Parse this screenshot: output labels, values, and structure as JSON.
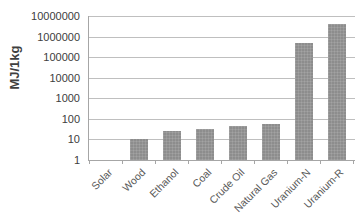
{
  "chart_data": {
    "type": "bar",
    "title": "",
    "xlabel": "",
    "ylabel": "MJ/1kg",
    "yscale": "log",
    "ylim": [
      1,
      10000000
    ],
    "grid": true,
    "legend": false,
    "categories": [
      "Solar",
      "Wood",
      "Ethanol",
      "Coal",
      "Crude Oil",
      "Natural Gas",
      "Uranium-N",
      "Uranium-R"
    ],
    "values": [
      0,
      10,
      27,
      32,
      45,
      55,
      500000,
      3900000
    ],
    "ytick_labels": [
      "10000000",
      "1000000",
      "100000",
      "10000",
      "1000",
      "100",
      "10",
      "1"
    ],
    "ytick_values": [
      10000000,
      1000000,
      100000,
      10000,
      1000,
      100,
      10,
      1
    ],
    "series": [
      {
        "name": "Energy density",
        "values": [
          0,
          10,
          27,
          32,
          45,
          55,
          500000,
          3900000
        ]
      }
    ],
    "colors": {
      "bar_fill": "#8d8d8d",
      "gridline": "#bfbfbf",
      "axis": "#a6a6a6",
      "text": "#404040",
      "background": "#ffffff"
    }
  }
}
